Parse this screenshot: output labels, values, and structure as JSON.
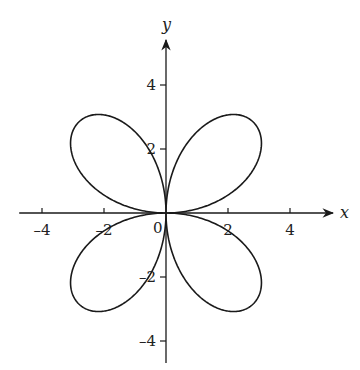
{
  "chart_data": {
    "type": "line",
    "subtype": "polar-curve",
    "title": "",
    "equation": "r = 4 sin(2θ)",
    "xlabel": "x",
    "ylabel": "y",
    "xlim": [
      -4.8,
      5.4
    ],
    "ylim": [
      -4.8,
      5.2
    ],
    "x_ticks": [
      -4,
      -2,
      2,
      4
    ],
    "x_tick_labels": [
      "-4",
      "-2",
      "2",
      "4"
    ],
    "y_ticks": [
      4,
      2,
      -2,
      -4
    ],
    "y_tick_labels": [
      "4",
      "2",
      "-2",
      "-4"
    ],
    "origin_label": "0",
    "grid": false,
    "legend": null,
    "series": [
      {
        "name": "four-leaved rose",
        "amplitude": 4,
        "petals": 4,
        "theta_range": [
          0,
          6.283185
        ],
        "petal_tips": [
          [
            2.83,
            2.83
          ],
          [
            -2.83,
            2.83
          ],
          [
            -2.83,
            -2.83
          ],
          [
            2.83,
            -2.83
          ]
        ],
        "max_extent": 3.08
      }
    ],
    "colors": {
      "curve": "#1a1a1a",
      "axes": "#1a1a1a",
      "background": "#ffffff"
    }
  }
}
